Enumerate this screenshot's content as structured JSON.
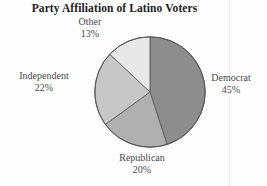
{
  "chart_data": {
    "type": "pie",
    "title": "Party Affiliation of Latino Voters",
    "categories": [
      "Democrat",
      "Republican",
      "Independent",
      "Other"
    ],
    "values": [
      45,
      20,
      22,
      13
    ],
    "value_suffix": "%",
    "start_angle_deg": 0,
    "direction": "clockwise",
    "legend": "none",
    "labels_position": "outside",
    "colors": [
      "#8d8d8d",
      "#b0b0b0",
      "#c7c7c7",
      "#e8e8e8"
    ],
    "outline_color": "#555555",
    "slices": [
      {
        "name": "Democrat",
        "value": 45,
        "label": "Democrat",
        "value_label": "45%",
        "color": "#8d8d8d"
      },
      {
        "name": "Republican",
        "value": 20,
        "label": "Republican",
        "value_label": "20%",
        "color": "#b0b0b0"
      },
      {
        "name": "Independent",
        "value": 22,
        "label": "Independent",
        "value_label": "22%",
        "color": "#c7c7c7"
      },
      {
        "name": "Other",
        "value": 13,
        "label": "Other",
        "value_label": "13%",
        "color": "#e8e8e8"
      }
    ]
  },
  "figure": {
    "title": "Party Affiliation of Latino Voters",
    "background": "#fdfdfd"
  }
}
